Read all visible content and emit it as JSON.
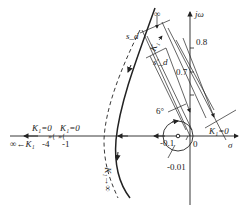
{
  "diagram": {
    "type": "root-locus",
    "axes": {
      "imag_label": "jω",
      "real_label": "σ",
      "origin_label": "0"
    },
    "imag_ticks": [
      "0.8",
      "0.7"
    ],
    "real_ticks": [
      "-0.1",
      "-0.01"
    ],
    "left_axis_labels": {
      "k1_zero_a": "K₁=0",
      "k1_zero_b": "K₁=0",
      "inf_label": "∞←K₁",
      "tick_minus4": "-4",
      "tick_minus1": "-1"
    },
    "annotations": {
      "s_d": "s_d",
      "s_d_prime": "s'_d",
      "k1_up": "K₁",
      "k1_up_inf": "∞",
      "k1_down": "K₁→∞",
      "angle": "6°",
      "k1_zero_right": "K₁=0"
    }
  }
}
